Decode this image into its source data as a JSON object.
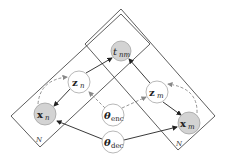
{
  "diagram": {
    "type": "probabilistic graphical model (plate notation)",
    "colors": {
      "observed_fill": "#d3d3d3",
      "latent_fill": "#ffffff",
      "stroke": "#222222",
      "inference_edge": "#888888"
    },
    "nodes": [
      {
        "id": "t_nm",
        "main": "t",
        "sub": "nm",
        "bold": false,
        "observed": true
      },
      {
        "id": "z_n",
        "main": "z",
        "sub": "n",
        "bold": true,
        "observed": false
      },
      {
        "id": "z_m",
        "main": "z",
        "sub": "m",
        "bold": true,
        "observed": false
      },
      {
        "id": "x_n",
        "main": "x",
        "sub": "n",
        "bold": true,
        "observed": true
      },
      {
        "id": "x_m",
        "main": "x",
        "sub": "m",
        "bold": true,
        "observed": true
      },
      {
        "id": "theta_enc",
        "main": "θ",
        "sub": "enc",
        "bold": true,
        "observed": false
      },
      {
        "id": "theta_dec",
        "main": "θ",
        "sub": "dec",
        "bold": true,
        "observed": false
      }
    ],
    "plates": [
      {
        "id": "plate-n",
        "label": "N"
      },
      {
        "id": "plate-m",
        "label": "N"
      }
    ],
    "edges": [
      {
        "from": "z_n",
        "to": "t_nm",
        "style": "solid"
      },
      {
        "from": "z_m",
        "to": "t_nm",
        "style": "solid"
      },
      {
        "from": "z_n",
        "to": "x_n",
        "style": "solid"
      },
      {
        "from": "z_m",
        "to": "x_m",
        "style": "solid"
      },
      {
        "from": "theta_dec",
        "to": "x_n",
        "style": "solid"
      },
      {
        "from": "theta_dec",
        "to": "x_m",
        "style": "solid"
      },
      {
        "from": "theta_enc",
        "to": "z_n",
        "style": "dashed"
      },
      {
        "from": "theta_enc",
        "to": "z_m",
        "style": "dashed"
      },
      {
        "from": "x_n",
        "to": "z_n",
        "style": "dashed-curved"
      },
      {
        "from": "x_m",
        "to": "z_m",
        "style": "dashed-curved"
      }
    ]
  }
}
